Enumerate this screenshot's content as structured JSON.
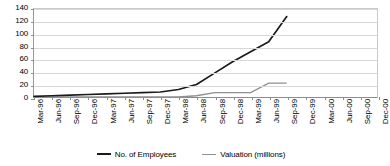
{
  "chart_data": {
    "type": "line",
    "title": "",
    "subtitle": "",
    "xlabel": "",
    "ylabel": "",
    "ylim": [
      0,
      140
    ],
    "ytick_values": [
      0,
      20,
      40,
      60,
      80,
      100,
      120,
      140
    ],
    "ytick_labels": [
      "0",
      "20",
      "40",
      "60",
      "80",
      "100",
      "120",
      "140"
    ],
    "grid": true,
    "legend_position": "bottom",
    "categories": [
      "Mar-96",
      "Jun-96",
      "Sep-96",
      "Dec-96",
      "Mar-97",
      "Jun-97",
      "Sep-97",
      "Dec-97",
      "Mar-98",
      "Jun-98",
      "Sep-98",
      "Dec-98",
      "Mar-99",
      "Jun-99",
      "Sep-99",
      "Dec-99",
      "Mar-00",
      "Jun-00",
      "Sep-00",
      "Dec-00"
    ],
    "series": [
      {
        "name": "No. of Employees",
        "color": "#1a1a1a",
        "values": [
          1,
          2,
          3,
          4,
          5,
          6,
          7,
          8,
          12,
          20,
          38,
          56,
          72,
          88,
          128,
          null,
          null,
          null,
          null,
          null
        ]
      },
      {
        "name": "Valuation (millions)",
        "color": "#8f8f8f",
        "values": [
          0,
          0,
          0,
          0,
          0,
          0,
          0,
          0,
          0,
          2,
          7,
          7,
          7,
          22,
          22,
          null,
          null,
          null,
          null,
          null
        ]
      }
    ]
  },
  "legend": {
    "items": [
      {
        "label": "No. of Employees",
        "color": "#1a1a1a"
      },
      {
        "label": "Valuation (millions)",
        "color": "#8f8f8f"
      }
    ]
  }
}
